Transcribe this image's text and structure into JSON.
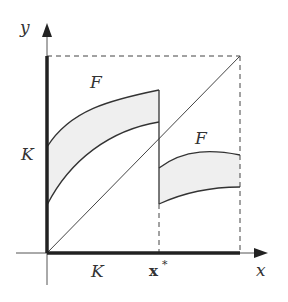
{
  "diagram": {
    "axes": {
      "x_label": "x",
      "y_label": "y"
    },
    "labels": {
      "y_axis_tick": "K",
      "x_axis_tick": "K",
      "x_star": "x",
      "x_star_sup": "*",
      "region_left": "F",
      "region_right": "F"
    },
    "colors": {
      "line": "#333333",
      "fill": "#efefef",
      "background": "#ffffff"
    }
  }
}
